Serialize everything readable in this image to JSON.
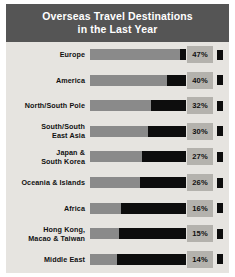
{
  "chart_data": {
    "type": "bar",
    "title": "Overseas Travel Destinations in the Last Year",
    "title_line1": "Overseas Travel Destinations",
    "title_line2": "in the Last Year",
    "xlabel": "",
    "ylabel": "",
    "orientation": "horizontal",
    "value_suffix": "%",
    "xlim": [
      0,
      50
    ],
    "grid": false,
    "legend": null,
    "categories": [
      "Europe",
      "America",
      "North/South Pole",
      "South/South East Asia",
      "Japan & South Korea",
      "Oceania & Islands",
      "Africa",
      "Hong Kong, Macao & Taiwan",
      "Middle East"
    ],
    "values": [
      47,
      40,
      32,
      30,
      27,
      26,
      16,
      15,
      14
    ],
    "colors": {
      "header_background": "#555555",
      "panel_background": "#e6e4e0",
      "bar_fill": "#8a8a8a",
      "bar_remainder": "#0d0d0d",
      "value_box": "#b4b2ad",
      "title_text": "#ffffff",
      "label_text": "#111111"
    }
  },
  "rows": [
    {
      "label_line1": "Europe",
      "label_line2": "",
      "value": "47%",
      "pct": 47
    },
    {
      "label_line1": "America",
      "label_line2": "",
      "value": "40%",
      "pct": 40
    },
    {
      "label_line1": "North/South Pole",
      "label_line2": "",
      "value": "32%",
      "pct": 32
    },
    {
      "label_line1": "South/South",
      "label_line2": "East Asia",
      "value": "30%",
      "pct": 30
    },
    {
      "label_line1": "Japan &",
      "label_line2": "South Korea",
      "value": "27%",
      "pct": 27
    },
    {
      "label_line1": "Oceania & Islands",
      "label_line2": "",
      "value": "26%",
      "pct": 26
    },
    {
      "label_line1": "Africa",
      "label_line2": "",
      "value": "16%",
      "pct": 16
    },
    {
      "label_line1": "Hong Kong,",
      "label_line2": "Macao & Taiwan",
      "value": "15%",
      "pct": 15
    },
    {
      "label_line1": "Middle East",
      "label_line2": "",
      "value": "14%",
      "pct": 14
    }
  ]
}
